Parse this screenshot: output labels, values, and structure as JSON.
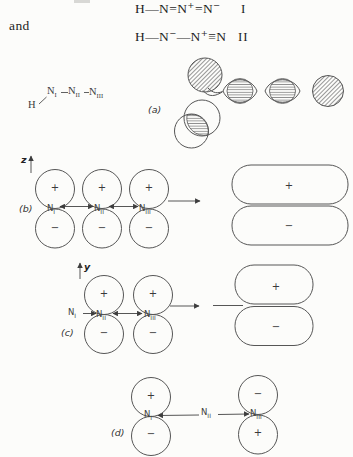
{
  "resonance": {
    "conjunction": "and",
    "structure_i": {
      "formula": "H—N=N⁺=N⁻",
      "numeral": "I"
    },
    "structure_ii": {
      "formula": "H—N⁻—N⁺≡N",
      "numeral": "II"
    }
  },
  "skeleton": {
    "hydrogen": "H",
    "nitrogen": "N"
  },
  "roman": {
    "i": "I",
    "ii": "II",
    "iii": "III"
  },
  "panels": {
    "a": "(a)",
    "b": "(b)",
    "c": "(c)",
    "d": "(d)"
  },
  "axes": {
    "panel_b": "z",
    "panel_c": "y"
  },
  "signs": {
    "plus": "+",
    "minus": "−"
  },
  "colors": {
    "paper": "#fcfcfa",
    "ink": "#1e1e1e",
    "line": "#4a4a4a"
  }
}
